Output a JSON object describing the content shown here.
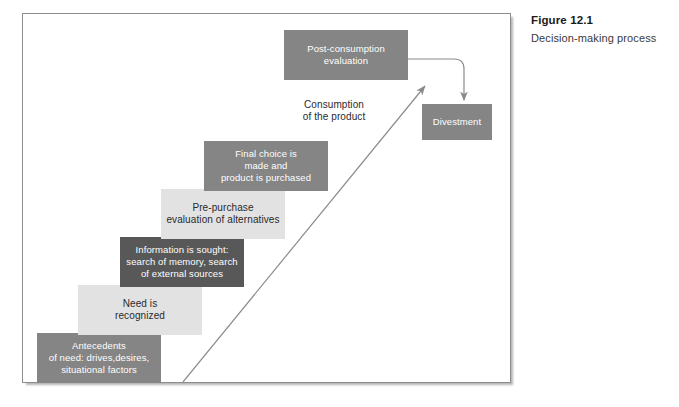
{
  "figure": {
    "caption_title": "Figure 12.1",
    "caption_subtitle": "Decision-making process"
  },
  "diagram": {
    "type": "staircase-process-flow",
    "steps": [
      {
        "id": "antecedents",
        "order": 1,
        "label": "Antecedents\nof need: drives,desires,\nsituational factors",
        "tone": "medium",
        "fill": "#858585",
        "text_color": "#ffffff"
      },
      {
        "id": "need-recognized",
        "order": 2,
        "label": "Need is\nrecognized",
        "tone": "light",
        "fill": "#e2e2e2",
        "text_color": "#2a2a2a"
      },
      {
        "id": "information-sought",
        "order": 3,
        "label": "Information is sought:\nsearch of memory, search\nof external sources",
        "tone": "dark",
        "fill": "#585858",
        "text_color": "#ffffff"
      },
      {
        "id": "pre-purchase-evaluation",
        "order": 4,
        "label": "Pre-purchase\nevaluation of alternatives",
        "tone": "light",
        "fill": "#e2e2e2",
        "text_color": "#2a2a2a"
      },
      {
        "id": "final-choice",
        "order": 5,
        "label": "Final choice is\nmade and\nproduct is purchased",
        "tone": "medium",
        "fill": "#858585",
        "text_color": "#ffffff"
      },
      {
        "id": "consumption",
        "order": 6,
        "label": "Consumption\nof the product",
        "tone": "none",
        "fill": "transparent",
        "text_color": "#2a2a2a"
      },
      {
        "id": "post-consumption-evaluation",
        "order": 7,
        "label": "Post-consumption\nevaluation",
        "tone": "medium",
        "fill": "#858585",
        "text_color": "#ffffff"
      },
      {
        "id": "divestment",
        "order": 8,
        "label": "Divestment",
        "tone": "medium",
        "fill": "#858585",
        "text_color": "#ffffff"
      }
    ],
    "connectors": [
      {
        "id": "progression-arrow",
        "kind": "diagonal-arrow",
        "from": "antecedents",
        "to": "post-consumption-evaluation",
        "color": "#8a8a8a"
      },
      {
        "id": "divestment-arrow",
        "kind": "elbow-arrow",
        "from": "post-consumption-evaluation",
        "to": "divestment",
        "color": "#8a8a8a"
      }
    ]
  },
  "colors": {
    "frame_border": "#8d8d8d",
    "page_background": "#ffffff",
    "tone_light": "#e2e2e2",
    "tone_medium": "#858585",
    "tone_dark": "#585858",
    "connector": "#8a8a8a"
  }
}
